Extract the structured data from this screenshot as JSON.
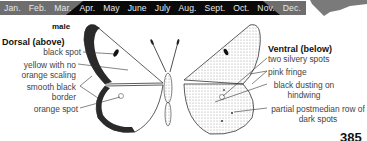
{
  "flight_period": {
    "months": [
      "Jan.",
      "Feb.",
      "Mar.",
      "Apr.",
      "May",
      "June",
      "July",
      "Aug.",
      "Sept.",
      "Oct.",
      "Nov.",
      "Dec."
    ],
    "active_from": "Mar.",
    "active_to": "Nov.",
    "colors": {
      "inactive": "#6e6e6e",
      "active": "#0a0a0a",
      "text": "#e8e8e8"
    }
  },
  "range_map": {
    "icon": "range-map-icon",
    "color": "#7a7a7a"
  },
  "illustration": {
    "sex": "male",
    "dorsal": {
      "heading": "Dorsal (above)",
      "labels": [
        {
          "text": "black spot"
        },
        {
          "text": "yellow with no orange scaling"
        },
        {
          "text": "smooth black border"
        },
        {
          "text": "orange spot"
        }
      ]
    },
    "ventral": {
      "heading": "Ventral (below)",
      "labels": [
        {
          "text": "two silvery spots"
        },
        {
          "text": "pink fringe"
        },
        {
          "text": "black dusting on hindwing"
        },
        {
          "text": "partial postmedian row of dark spots"
        }
      ]
    }
  },
  "page_number": "385"
}
